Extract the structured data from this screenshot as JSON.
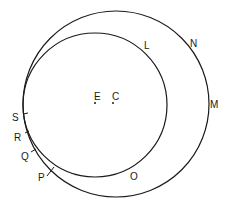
{
  "diagram": {
    "type": "two-circles-eccentric",
    "stroke_color": "#1a1a1a",
    "background": "#ffffff",
    "outer_circle": {
      "label": "outer-circle",
      "cx": 116,
      "cy": 104,
      "r": 93
    },
    "inner_circle": {
      "label": "inner-circle",
      "cx": 95,
      "cy": 105,
      "r": 72
    },
    "points": {
      "E": {
        "text": "E",
        "dot_x": 95,
        "dot_y": 103,
        "tx": 93,
        "ty": 100
      },
      "C": {
        "text": "C",
        "dot_x": 113,
        "dot_y": 103,
        "tx": 112,
        "ty": 100
      },
      "L": {
        "text": "L",
        "tx": 144,
        "ty": 49
      },
      "N": {
        "text": "N",
        "tx": 190,
        "ty": 47
      },
      "M": {
        "text": "M",
        "tx": 210,
        "ty": 108
      },
      "S": {
        "text": "S",
        "tx": 12,
        "ty": 120
      },
      "R": {
        "text": "R",
        "tx": 14,
        "ty": 140
      },
      "Q": {
        "text": "Q",
        "tx": 20,
        "ty": 159
      },
      "P": {
        "text": "P",
        "tx": 37,
        "ty": 180
      },
      "O": {
        "text": "O",
        "tx": 130,
        "ty": 180
      }
    }
  }
}
